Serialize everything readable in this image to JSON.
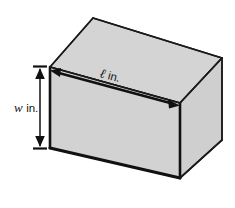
{
  "figure": {
    "kind": "rectangular-prism-diagram",
    "background_color": "#ffffff",
    "labels": {
      "length": {
        "symbol": "ℓ",
        "unit": "in.",
        "full": "ℓ in.",
        "placement": "top of front face, along diagonal arrow"
      },
      "width": {
        "symbol": "w",
        "unit": "in.",
        "full": "w in.",
        "placement": "left of front face, along vertical arrow"
      }
    },
    "colors": {
      "face_front": "#d2d2d2",
      "face_top": "#d4d4d4",
      "face_right": "#d0d0d0",
      "outline": "#1a1a1a",
      "outline_thin": "#4a4a4a",
      "arrow": "#111111",
      "text": "#161616"
    },
    "geometry": {
      "front_face": [
        [
          50,
          67
        ],
        [
          180,
          103
        ],
        [
          180,
          178
        ],
        [
          50,
          148
        ]
      ],
      "top_face": [
        [
          50,
          67
        ],
        [
          93,
          18
        ],
        [
          222,
          58
        ],
        [
          180,
          103
        ]
      ],
      "right_face": [
        [
          180,
          103
        ],
        [
          222,
          58
        ],
        [
          222,
          140
        ],
        [
          180,
          178
        ]
      ],
      "length_arrow": {
        "from": [
          55,
          72
        ],
        "to": [
          175,
          104
        ]
      },
      "width_arrow": {
        "from": [
          40,
          67
        ],
        "to": [
          40,
          148
        ]
      }
    }
  }
}
